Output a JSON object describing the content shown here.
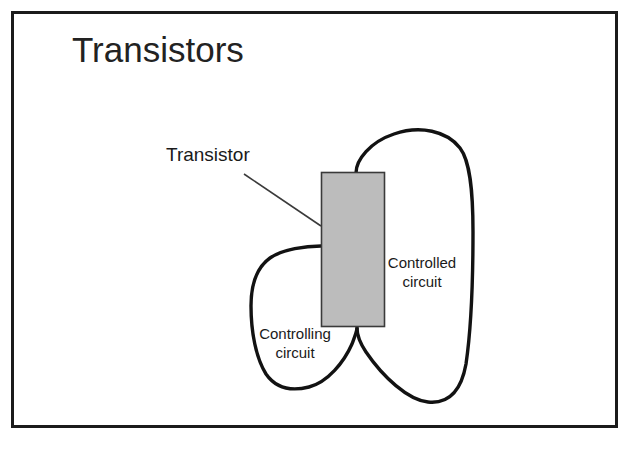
{
  "slide": {
    "title": "Transistors",
    "background_color": "#ffffff",
    "border_color": "#1b1b1b"
  },
  "diagram": {
    "type": "transistor-circuit-schematic",
    "transistor_block": {
      "label": "Transistor",
      "fill_color": "#bcbcbc",
      "stroke_color": "#3a3a3a",
      "x": 321,
      "y": 172,
      "width": 64,
      "height": 155
    },
    "leader_line": {
      "name": "transistor-leader-line",
      "from_x": 244,
      "from_y": 174,
      "to_x": 321,
      "to_y": 226,
      "color": "#3a3a3a"
    },
    "loops": [
      {
        "name": "controlled-circuit-loop",
        "label": "Controlled circuit",
        "label_line_1": "Controlled",
        "label_line_2": "circuit",
        "stroke_color": "#121212",
        "stroke_width": 3.4
      },
      {
        "name": "controlling-circuit-loop",
        "label": "Controlling circuit",
        "label_line_1": "Controlling",
        "label_line_2": "circuit",
        "stroke_color": "#121212",
        "stroke_width": 3.4
      }
    ]
  }
}
